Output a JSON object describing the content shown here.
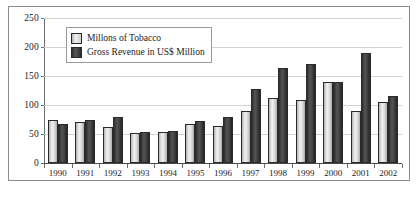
{
  "chart_data": {
    "type": "bar",
    "title": "",
    "xlabel": "",
    "ylabel": "",
    "ylim": [
      0,
      250
    ],
    "yticks": [
      0,
      50,
      100,
      150,
      200,
      250
    ],
    "grid": true,
    "legend_position": "upper-left-inside",
    "categories": [
      "1990",
      "1991",
      "1992",
      "1993",
      "1994",
      "1995",
      "1996",
      "1997",
      "1998",
      "1999",
      "2000",
      "2001",
      "2002"
    ],
    "series": [
      {
        "name": "Millons of Tobacco",
        "color": "#d8d8d8",
        "values": [
          75,
          70,
          62,
          52,
          54,
          68,
          64,
          90,
          112,
          108,
          140,
          89,
          105
        ]
      },
      {
        "name": "Gross Revenue in US$ Million",
        "color": "#3a3a3a",
        "values": [
          68,
          75,
          80,
          54,
          55,
          73,
          80,
          128,
          163,
          170,
          140,
          190,
          115
        ]
      }
    ]
  },
  "legend": {
    "entries": [
      {
        "label": "Millons of Tobacco"
      },
      {
        "label": "Gross Revenue in US$ Million"
      }
    ]
  },
  "axis": {
    "y_tick_labels": [
      "250",
      "200",
      "150",
      "100",
      "50",
      "0"
    ],
    "x_tick_labels": [
      "1990",
      "1991",
      "1992",
      "1993",
      "1994",
      "1995",
      "1996",
      "1997",
      "1998",
      "1999",
      "2000",
      "2001",
      "2002"
    ]
  },
  "colors": {
    "frame": "#8d8d8d",
    "grid": "#d2d2d2",
    "axis": "#6d6d6d",
    "text": "#1b1b1b",
    "series_light": "#d8d8d8",
    "series_dark": "#3a3a3a",
    "background": "#ffffff"
  }
}
